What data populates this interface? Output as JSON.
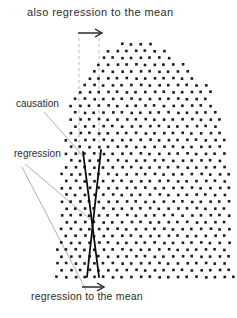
{
  "labels": {
    "top": "also regression to the mean",
    "causation": "causation",
    "regression": "regression",
    "bottom": "regression to the mean"
  },
  "colors": {
    "background": "#ffffff",
    "dot": "#1c1c1c",
    "text": "#2b2b2b",
    "solid_line": "#0a0a0a",
    "leader_line": "#9a9a9a",
    "dashed_line": "#b8b8b8",
    "arrow": "#1c1c1c"
  },
  "geometry": {
    "dashed_lines": [
      {
        "name": "dashed-guide-left",
        "x": 79,
        "y1": 38,
        "y2": 158
      },
      {
        "name": "dashed-guide-right",
        "x": 99,
        "y1": 38,
        "y2": 158
      }
    ],
    "solid_lines": [
      {
        "name": "causation-line",
        "x1": 83,
        "y1": 152,
        "x2": 99,
        "y2": 277
      },
      {
        "name": "regression-line",
        "x1": 101,
        "y1": 150,
        "x2": 87,
        "y2": 277
      }
    ],
    "leader_lines": [
      {
        "name": "causation-leader",
        "x1": 44,
        "y1": 112,
        "x2": 84,
        "y2": 157
      },
      {
        "name": "regression-leader-mid",
        "x1": 25,
        "y1": 164,
        "x2": 91,
        "y2": 220
      },
      {
        "name": "regression-leader-bottom",
        "x1": 22,
        "y1": 167,
        "x2": 86,
        "y2": 290
      }
    ],
    "arrows": [
      {
        "name": "shift-arrow-top",
        "x1": 78,
        "y1": 33,
        "x2": 102,
        "y2": 33
      },
      {
        "name": "shift-arrow-bottom",
        "x1": 82,
        "y1": 287,
        "x2": 104,
        "y2": 287
      }
    ],
    "dot_field": {
      "row_spacing": 6.85,
      "col_spacing": 9.3,
      "dot_size": 2.6,
      "y_bottom": 277,
      "y_top": 38,
      "outline": [
        [
          278,
          57,
          233
        ],
        [
          240,
          58,
          232
        ],
        [
          200,
          60,
          231
        ],
        [
          160,
          64,
          228
        ],
        [
          130,
          68,
          224
        ],
        [
          110,
          70,
          219
        ],
        [
          90,
          76,
          210
        ],
        [
          75,
          84,
          196
        ],
        [
          62,
          95,
          180
        ],
        [
          52,
          105,
          168
        ],
        [
          45,
          113,
          159
        ],
        [
          38,
          122,
          152
        ]
      ]
    }
  }
}
